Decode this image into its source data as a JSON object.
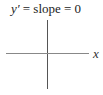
{
  "diagram": {
    "title_var": "y′",
    "title_rest": " = slope = 0",
    "x_axis_label": "x",
    "colors": {
      "vertical_axis": "#555555",
      "horizontal_axis": "#888888",
      "text": "#222222"
    }
  }
}
